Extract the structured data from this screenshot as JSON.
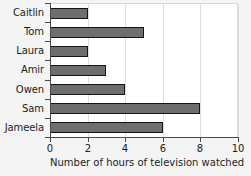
{
  "chart_data": {
    "type": "bar",
    "orientation": "horizontal",
    "title": "",
    "xlabel": "Number of hours of television watched",
    "ylabel": "",
    "categories": [
      "Caitlin",
      "Tom",
      "Laura",
      "Amir",
      "Owen",
      "Sam",
      "Jameela"
    ],
    "values": [
      2,
      5,
      2,
      3,
      4,
      8,
      6
    ],
    "xlim": [
      0,
      10
    ],
    "xticks": [
      0,
      2,
      4,
      6,
      8,
      10
    ],
    "xtick_labels": [
      "0",
      "2",
      "4",
      "6",
      "8",
      "10"
    ],
    "grid": true,
    "grid_axis": "x",
    "legend": false,
    "bar_color": "#6e6e6e",
    "bar_edge_color": "#151515",
    "plot_background": "#ffffff",
    "figure_background": "#f4f4f4",
    "gridline_color": "#dedede",
    "axis_color": "#4a4a4a",
    "text_color": "#1c1c1c"
  }
}
